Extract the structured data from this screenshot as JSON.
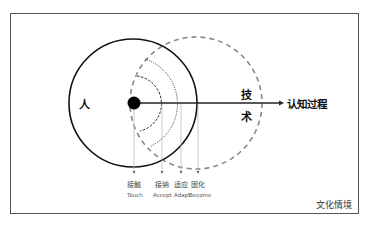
{
  "diagram": {
    "labels": {
      "person": "人",
      "tech_line1": "技",
      "tech_line2": "术",
      "axis": "认知过程",
      "context": "文化情境"
    },
    "stages": [
      {
        "cn": "接触",
        "en": "Touch"
      },
      {
        "cn": "接纳",
        "en": "Accept"
      },
      {
        "cn": "适应",
        "en": "Adapt"
      },
      {
        "cn": "固化",
        "en": "Become"
      }
    ],
    "colors": {
      "stroke": "#111111",
      "dashed_circle": "#888888",
      "frame": "#555555",
      "guide": "#bbbbbb"
    }
  }
}
